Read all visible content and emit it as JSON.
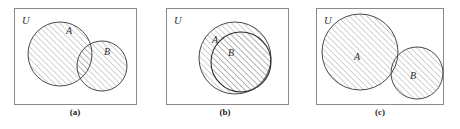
{
  "figure": {
    "width": 460,
    "height": 129,
    "background": "#ffffff",
    "frame_color": "#8a8a8a",
    "circle_stroke_color": "#4a4a4a",
    "hatch_color": "#9a9a9a",
    "label_color": "#2b2b2b"
  },
  "panels": [
    {
      "id": "a",
      "caption": "(a)",
      "universe_label": "U",
      "set_a_label": "A",
      "set_b_label": "B",
      "relation": "overlapping",
      "shaded": "A union B",
      "frame": {
        "x": 14,
        "y": 8,
        "w": 123,
        "h": 97
      },
      "circle_a": {
        "cx": 60,
        "cy": 54,
        "r": 32
      },
      "circle_b": {
        "cx": 102,
        "cy": 66,
        "r": 25
      },
      "label_a_pos": {
        "x": 66,
        "y": 32
      },
      "label_b_pos": {
        "x": 106,
        "y": 53
      },
      "label_u_pos": {
        "x": 22,
        "y": 22
      }
    },
    {
      "id": "b",
      "caption": "(b)",
      "universe_label": "U",
      "set_a_label": "A",
      "set_b_label": "B",
      "relation": "subset",
      "shaded": "A union B",
      "frame": {
        "x": 166,
        "y": 8,
        "w": 123,
        "h": 97
      },
      "circle_a": {
        "cx": 235,
        "cy": 58,
        "r": 36
      },
      "circle_b": {
        "cx": 241,
        "cy": 62,
        "r": 30
      },
      "label_a_pos": {
        "x": 214,
        "y": 41
      },
      "label_b_pos": {
        "x": 230,
        "y": 53
      },
      "label_u_pos": {
        "x": 174,
        "y": 22
      }
    },
    {
      "id": "c",
      "caption": "(c)",
      "universe_label": "U",
      "set_a_label": "A",
      "set_b_label": "B",
      "relation": "disjoint",
      "shaded": "A union B",
      "frame": {
        "x": 316,
        "y": 8,
        "w": 128,
        "h": 97
      },
      "circle_a": {
        "cx": 360,
        "cy": 52,
        "r": 38
      },
      "circle_b": {
        "cx": 417,
        "cy": 73,
        "r": 26
      },
      "label_a_pos": {
        "x": 356,
        "y": 58
      },
      "label_b_pos": {
        "x": 412,
        "y": 76
      },
      "label_u_pos": {
        "x": 325,
        "y": 22
      }
    }
  ]
}
